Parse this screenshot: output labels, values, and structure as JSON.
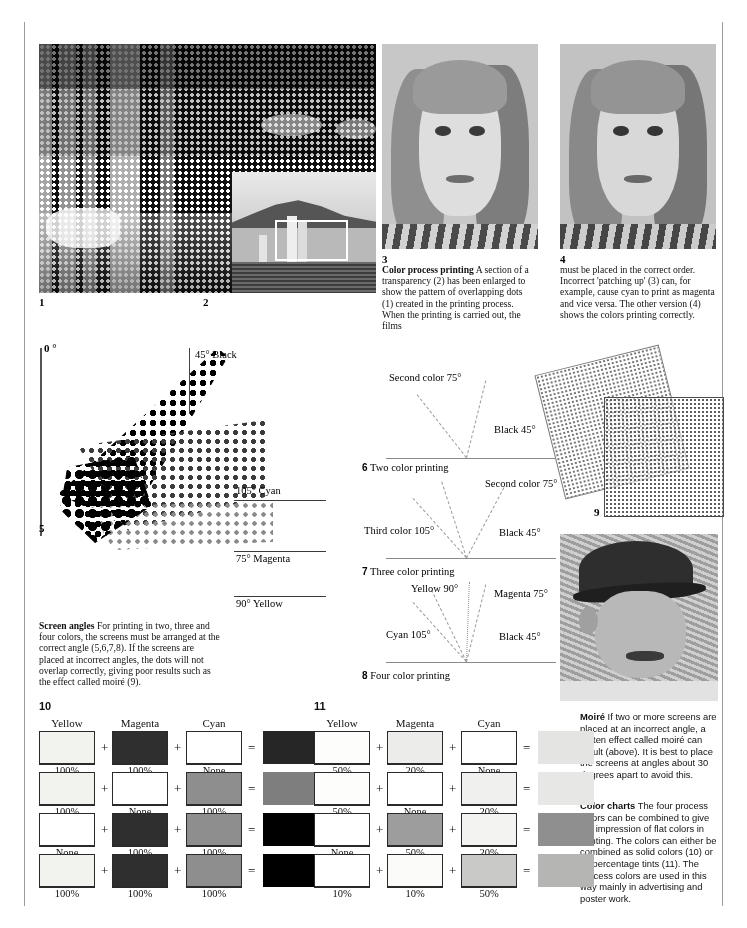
{
  "page": {
    "figure_numbers": {
      "f1": "1",
      "f2": "2",
      "f3": "3",
      "f4": "4",
      "f5": "5",
      "f6": "6",
      "f7": "7",
      "f8": "8",
      "f9": "9",
      "f10": "10",
      "f11": "11"
    }
  },
  "captions": {
    "color_process": {
      "heading": "Color process printing",
      "body": " A section of a transparency (2) has been enlarged to show the pattern of overlapping dots (1) created in the printing process. When the printing is carried out, the films"
    },
    "color_process_cont": {
      "body": "must be placed in the correct order. Incorrect 'patching up' (3) can, for example, cause cyan to print as magenta and vice versa. The other version (4) shows the colors printing correctly."
    },
    "screen_angles": {
      "heading": "Screen angles",
      "body": " For printing in two, three and four colors, the screens must be arranged at the correct angle (5,6,7,8). If the screens are placed at incorrect angles, the dots will not overlap correctly, giving poor results such as the effect called moiré (9)."
    },
    "moire": {
      "heading": "Moiré",
      "body": " If two or more screens are placed at an incorrect angle, a patten effect called moiré can result (above). It is best to place the screens at angles about 30 degrees apart to avoid this."
    },
    "color_charts": {
      "heading": "Color charts",
      "body": " The four process colors can be combined to give the impression of flat colors in printing. The colors can either be combined as solid colors (10) or as percentage tints (11). The process colors are used in this way mainly in advertising and poster work."
    }
  },
  "screen_angle_diagram": {
    "zero_label": "0 °",
    "angles": [
      {
        "label": "45° Black",
        "value": 45,
        "color": "Black"
      },
      {
        "label": "105° Cyan",
        "value": 105,
        "color": "Cyan"
      },
      {
        "label": "75° Magenta",
        "value": 75,
        "color": "Magenta"
      },
      {
        "label": "90° Yellow",
        "value": 90,
        "color": "Yellow"
      }
    ]
  },
  "fan_diagrams": [
    {
      "id": "two-color",
      "title_number": "6",
      "title": "Two color printing",
      "rays": [
        {
          "label": "Second color 75°",
          "angle": 75,
          "side": "left"
        },
        {
          "label": "Black 45°",
          "angle": 45,
          "side": "right"
        }
      ]
    },
    {
      "id": "three-color",
      "title_number": "7",
      "title": "Three color printing",
      "rays": [
        {
          "label": "Third color 105°",
          "angle": 105,
          "side": "left"
        },
        {
          "label": "Second color 75°",
          "angle": 75,
          "side": "right"
        },
        {
          "label": "Black 45°",
          "angle": 45,
          "side": "right"
        }
      ]
    },
    {
      "id": "four-color",
      "title_number": "8",
      "title": "Four color printing",
      "rays": [
        {
          "label": "Cyan 105°",
          "angle": 105,
          "side": "left"
        },
        {
          "label": "Yellow 90°",
          "angle": 90,
          "side": "left"
        },
        {
          "label": "Magenta 75°",
          "angle": 75,
          "side": "right"
        },
        {
          "label": "Black 45°",
          "angle": 45,
          "side": "right"
        }
      ]
    }
  ],
  "chart_data": [
    {
      "type": "table",
      "id": "solid-colors",
      "title": "10",
      "columns": [
        "Yellow",
        "Magenta",
        "Cyan",
        "Result"
      ],
      "rows": [
        {
          "yellow": "100%",
          "magenta": "100%",
          "cyan": "None",
          "yellow_hex": "#f2f2ee",
          "magenta_hex": "#2f2f2f",
          "cyan_hex": "#ffffff",
          "result_hex": "#262626"
        },
        {
          "yellow": "100%",
          "magenta": "None",
          "cyan": "100%",
          "yellow_hex": "#f2f2ee",
          "magenta_hex": "#ffffff",
          "cyan_hex": "#8e8e8e",
          "result_hex": "#7e7e7e"
        },
        {
          "yellow": "None",
          "magenta": "100%",
          "cyan": "100%",
          "yellow_hex": "#ffffff",
          "magenta_hex": "#2f2f2f",
          "cyan_hex": "#8e8e8e",
          "result_hex": "#000000"
        },
        {
          "yellow": "100%",
          "magenta": "100%",
          "cyan": "100%",
          "yellow_hex": "#f2f2ee",
          "magenta_hex": "#2f2f2f",
          "cyan_hex": "#8e8e8e",
          "result_hex": "#000000"
        }
      ]
    },
    {
      "type": "table",
      "id": "percentage-tints",
      "title": "11",
      "columns": [
        "Yellow",
        "Magenta",
        "Cyan",
        "Result"
      ],
      "rows": [
        {
          "yellow": "50%",
          "magenta": "20%",
          "cyan": "None",
          "yellow_hex": "#fdfdfb",
          "magenta_hex": "#ececea",
          "cyan_hex": "#ffffff",
          "result_hex": "#e4e4e2"
        },
        {
          "yellow": "50%",
          "magenta": "None",
          "cyan": "20%",
          "yellow_hex": "#fdfdfb",
          "magenta_hex": "#ffffff",
          "cyan_hex": "#f0f0ee",
          "result_hex": "#e7e7e5"
        },
        {
          "yellow": "None",
          "magenta": "50%",
          "cyan": "20%",
          "yellow_hex": "#ffffff",
          "magenta_hex": "#9d9d9d",
          "cyan_hex": "#f3f3f1",
          "result_hex": "#8f8f8f"
        },
        {
          "yellow": "10%",
          "magenta": "10%",
          "cyan": "50%",
          "yellow_hex": "#ffffff",
          "magenta_hex": "#fbfbf9",
          "cyan_hex": "#c9c9c7",
          "result_hex": "#b5b5b3"
        }
      ]
    }
  ],
  "column_headers": [
    "Yellow",
    "Magenta",
    "Cyan"
  ],
  "operators": {
    "plus": "+",
    "equals": "="
  }
}
